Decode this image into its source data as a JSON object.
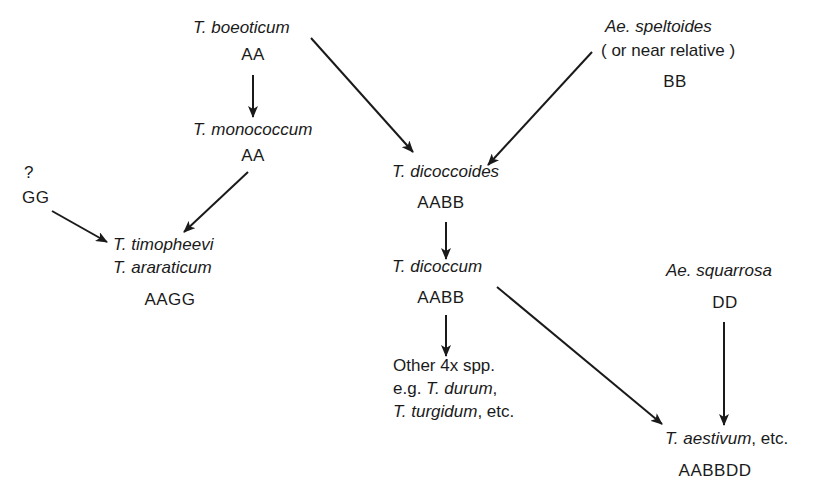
{
  "diagram": {
    "type": "wheat-evolution-genome-diagram",
    "stroke_color": "#1a1a1a",
    "nodes": {
      "boeoticum": {
        "species": "T. boeoticum",
        "genome": "AA"
      },
      "monococcum": {
        "species": "T. monococcum",
        "genome": "AA"
      },
      "unknown_g": {
        "species": "?",
        "genome": "GG"
      },
      "timopheevi": {
        "species_1": "T. timopheevi",
        "species_2": "T. araraticum",
        "genome": "AAGG"
      },
      "speltoides": {
        "species": "Ae. speltoides",
        "note": "( or near relative )",
        "genome": "BB"
      },
      "dicoccoides": {
        "species": "T. dicoccoides",
        "genome": "AABB"
      },
      "dicoccum": {
        "species": "T. dicoccum",
        "genome": "AABB"
      },
      "other4x": {
        "line_1": "Other 4x spp.",
        "line_2_prefix": "e.g. ",
        "line_2_species": "T. durum",
        "line_2_suffix": ",",
        "line_3_species": "T. turgidum",
        "line_3_suffix": ", etc."
      },
      "squarrosa": {
        "species": "Ae. squarrosa",
        "genome": "DD"
      },
      "aestivum": {
        "species": "T. aestivum",
        "suffix": ", etc.",
        "genome": "AABBDD"
      }
    },
    "edges": [
      {
        "from": "boeoticum",
        "to": "monococcum"
      },
      {
        "from": "monococcum",
        "to": "timopheevi"
      },
      {
        "from": "unknown_g",
        "to": "timopheevi"
      },
      {
        "from": "boeoticum",
        "to": "dicoccoides"
      },
      {
        "from": "speltoides",
        "to": "dicoccoides"
      },
      {
        "from": "dicoccoides",
        "to": "dicoccum"
      },
      {
        "from": "dicoccum",
        "to": "other4x"
      },
      {
        "from": "dicoccum",
        "to": "aestivum"
      },
      {
        "from": "squarrosa",
        "to": "aestivum"
      }
    ]
  }
}
